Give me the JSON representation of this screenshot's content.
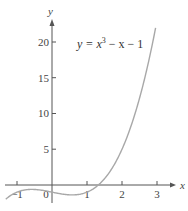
{
  "chart_data": {
    "type": "line",
    "title": "",
    "xlabel": "x",
    "ylabel": "y",
    "annotation": "y = x³ − x − 1",
    "function": "x^3 - x - 1",
    "xlim": [
      -1.4,
      3.6
    ],
    "ylim": [
      -3,
      23
    ],
    "x_ticks": [
      -1,
      0,
      1,
      2,
      3
    ],
    "y_ticks": [
      5,
      10,
      15,
      20
    ],
    "x_tick_labels": [
      "−1",
      "0",
      "1",
      "2",
      "3"
    ],
    "y_tick_labels": [
      "5",
      "10",
      "15",
      "20"
    ],
    "series": [
      {
        "name": "y = x³ − x − 1",
        "x": [
          -1.3,
          -1.0,
          -0.5,
          0,
          0.5,
          1.0,
          1.32,
          1.5,
          2.0,
          2.5,
          2.97
        ],
        "y": [
          -1.9,
          -1.0,
          -0.625,
          -1.0,
          -1.375,
          -1.0,
          0.0,
          0.875,
          5.0,
          12.125,
          22.23
        ]
      }
    ],
    "grid": false,
    "legend": "none",
    "colors": {
      "curve": "#a8a8a8",
      "axes": "#444444"
    }
  },
  "labels": {
    "x_axis": "x",
    "y_axis": "y",
    "equation_y": "y = x",
    "equation_exp": "3",
    "equation_rest": " − x − 1"
  }
}
